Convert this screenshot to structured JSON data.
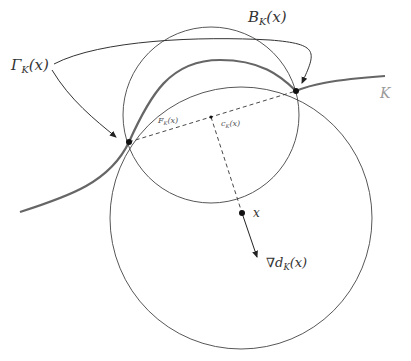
{
  "figure": {
    "labels": {
      "gamma": {
        "main": "Γ",
        "sub": "K",
        "arg": "(x)"
      },
      "ball": {
        "main": "B",
        "sub": "K",
        "arg": "(x)"
      },
      "set_k": {
        "main": "K"
      },
      "footprint": {
        "main": "F",
        "sub": "K",
        "arg": "(x)"
      },
      "center": {
        "main": "c",
        "sub": "K",
        "arg": "(x)"
      },
      "point_x": {
        "main": "x"
      },
      "gradient": {
        "main": "∇d",
        "sub": "K",
        "arg": "(x)"
      }
    },
    "colors": {
      "curve_k": "#666666",
      "circle_stroke": "#444444",
      "arrow": "#333333",
      "dashed": "#333333",
      "k_label": "#999999"
    }
  }
}
